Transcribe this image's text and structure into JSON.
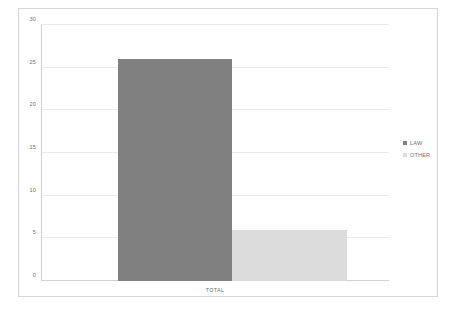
{
  "chart_data": {
    "type": "bar",
    "title": "",
    "subtitle": "",
    "xlabel": "",
    "ylabel": "",
    "categories": [
      "TOTAL"
    ],
    "series": [
      {
        "name": "LAW",
        "values": [
          26
        ],
        "color": "#808080"
      },
      {
        "name": "OTHER",
        "values": [
          6
        ],
        "color": "#dcdcdc"
      }
    ],
    "ylim": [
      0,
      30
    ],
    "yticks": [
      0,
      5,
      10,
      15,
      20,
      25,
      30
    ],
    "ytick_labels": [
      "0",
      "5",
      "10",
      "15",
      "20",
      "25",
      "30"
    ],
    "grid": true,
    "grid_axis": "y",
    "legend_position": "right",
    "plot_background": "#ffffff",
    "grid_color": "#e8e8e8",
    "axis_color": "#d0d0d0",
    "frame_border_color": "#d5d5d5",
    "tick_label_color": "#6e6e6e"
  },
  "legend": {
    "items": [
      {
        "label": "LAW",
        "color": "#808080"
      },
      {
        "label": "OTHER",
        "color": "#dcdcdc"
      }
    ]
  },
  "axes": {
    "category_label": "TOTAL"
  }
}
